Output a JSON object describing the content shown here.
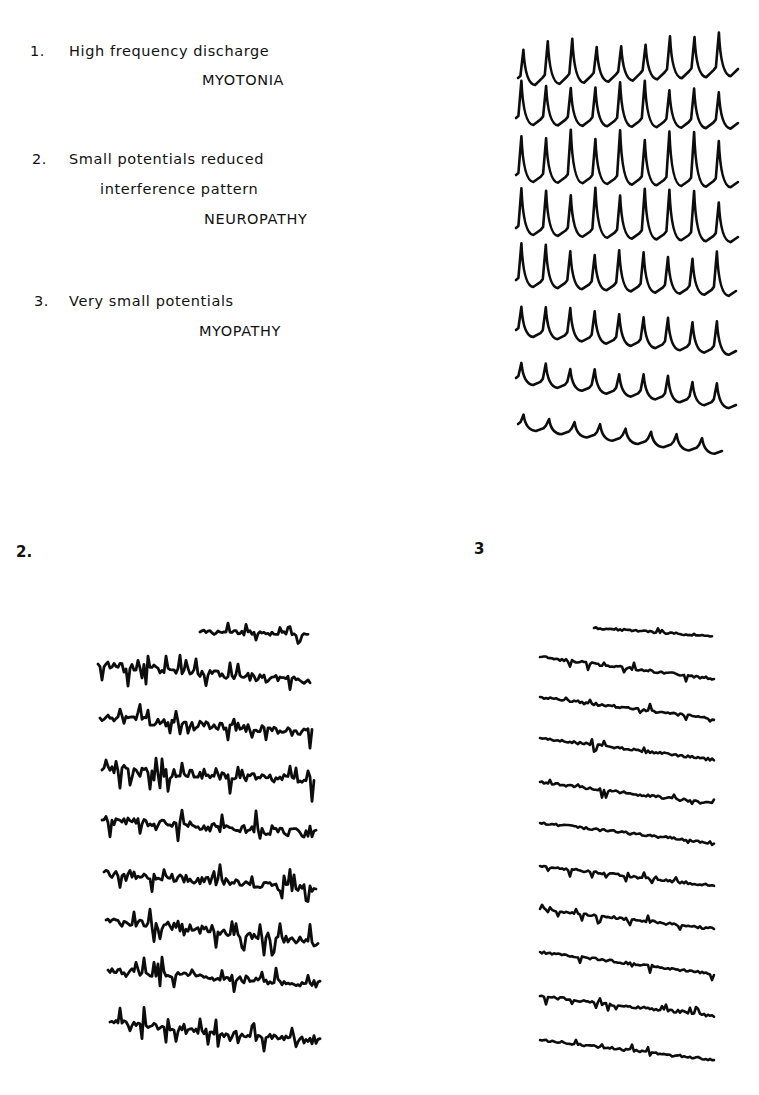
{
  "legend": {
    "items": [
      {
        "number": "1.",
        "line1": "High frequency discharge",
        "diagnosis": "MYOTONIA"
      },
      {
        "number": "2.",
        "line1": "Small potentials  reduced",
        "line2": "interference  pattern",
        "diagnosis": "NEUROPATHY"
      },
      {
        "number": "3.",
        "line1": "Very  small  potentials",
        "diagnosis": "MYOPATHY"
      }
    ]
  },
  "panels": {
    "panel1": {
      "label": "",
      "description": "High frequency discharge (myotonia) EMG traces"
    },
    "panel2": {
      "label": "2.",
      "description": "Small potentials, reduced interference pattern (neuropathy) EMG traces"
    },
    "panel3": {
      "label": "3",
      "description": "Very small potentials (myopathy) EMG traces"
    }
  },
  "traces": {
    "panel1": {
      "type": "spikes",
      "rows": [
        {
          "y": 78,
          "x0": 518,
          "x1": 738,
          "spikes": 9,
          "amp": 34,
          "slope": -10
        },
        {
          "y": 118,
          "x0": 516,
          "x1": 738,
          "spikes": 9,
          "amp": 36,
          "slope": 4
        },
        {
          "y": 175,
          "x0": 516,
          "x1": 738,
          "spikes": 9,
          "amp": 44,
          "slope": 6
        },
        {
          "y": 228,
          "x0": 516,
          "x1": 738,
          "spikes": 9,
          "amp": 40,
          "slope": 8
        },
        {
          "y": 280,
          "x0": 516,
          "x1": 736,
          "spikes": 9,
          "amp": 34,
          "slope": 10
        },
        {
          "y": 330,
          "x0": 516,
          "x1": 736,
          "spikes": 9,
          "amp": 26,
          "slope": 20
        },
        {
          "y": 378,
          "x0": 516,
          "x1": 736,
          "spikes": 9,
          "amp": 18,
          "slope": 26
        },
        {
          "y": 424,
          "x0": 518,
          "x1": 722,
          "spikes": 8,
          "amp": 10,
          "slope": 26
        }
      ]
    },
    "panel2": {
      "type": "noise",
      "rows": [
        {
          "y": 632,
          "x0": 200,
          "x1": 308,
          "amp": 9,
          "slope": 2
        },
        {
          "y": 664,
          "x0": 98,
          "x1": 310,
          "amp": 16,
          "slope": 18
        },
        {
          "y": 718,
          "x0": 100,
          "x1": 312,
          "amp": 16,
          "slope": 14
        },
        {
          "y": 770,
          "x0": 102,
          "x1": 314,
          "amp": 16,
          "slope": 10
        },
        {
          "y": 820,
          "x0": 102,
          "x1": 316,
          "amp": 16,
          "slope": 14
        },
        {
          "y": 872,
          "x0": 104,
          "x1": 316,
          "amp": 16,
          "slope": 18
        },
        {
          "y": 920,
          "x0": 106,
          "x1": 318,
          "amp": 16,
          "slope": 22
        },
        {
          "y": 970,
          "x0": 108,
          "x1": 320,
          "amp": 14,
          "slope": 14
        },
        {
          "y": 1022,
          "x0": 110,
          "x1": 320,
          "amp": 14,
          "slope": 20
        }
      ]
    },
    "panel3": {
      "type": "small",
      "rows": [
        {
          "y": 628,
          "x0": 594,
          "x1": 712,
          "amp": 4,
          "slope": 8
        },
        {
          "y": 657,
          "x0": 540,
          "x1": 714,
          "amp": 5,
          "slope": 22
        },
        {
          "y": 697,
          "x0": 540,
          "x1": 714,
          "amp": 5,
          "slope": 22
        },
        {
          "y": 738,
          "x0": 540,
          "x1": 714,
          "amp": 5,
          "slope": 22
        },
        {
          "y": 782,
          "x0": 540,
          "x1": 714,
          "amp": 5,
          "slope": 22
        },
        {
          "y": 823,
          "x0": 540,
          "x1": 714,
          "amp": 5,
          "slope": 20
        },
        {
          "y": 866,
          "x0": 540,
          "x1": 714,
          "amp": 5,
          "slope": 20
        },
        {
          "y": 909,
          "x0": 540,
          "x1": 714,
          "amp": 5,
          "slope": 20
        },
        {
          "y": 952,
          "x0": 540,
          "x1": 714,
          "amp": 5,
          "slope": 22
        },
        {
          "y": 996,
          "x0": 540,
          "x1": 714,
          "amp": 5,
          "slope": 20
        },
        {
          "y": 1040,
          "x0": 540,
          "x1": 714,
          "amp": 5,
          "slope": 20
        }
      ]
    }
  }
}
